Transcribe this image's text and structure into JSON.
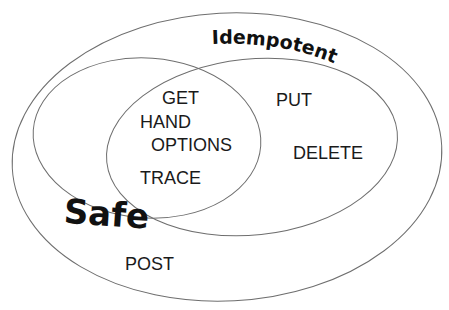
{
  "diagram": {
    "type": "venn",
    "sets": {
      "universe": {
        "label": ""
      },
      "safe": {
        "label": "Safe"
      },
      "idempotent": {
        "label": "Idempotent"
      }
    },
    "regions": {
      "safe_and_idempotent": [
        "GET",
        "HAND",
        "OPTIONS",
        "TRACE"
      ],
      "idempotent_only": [
        "PUT",
        "DELETE"
      ],
      "neither": [
        "POST"
      ]
    },
    "labels": {
      "get": "GET",
      "hand": "HAND",
      "options": "OPTIONS",
      "trace": "TRACE",
      "put": "PUT",
      "delete": "DELETE",
      "post": "POST",
      "safe_title": "Safe",
      "idempotent_title": "Idempotent"
    },
    "colors": {
      "outline": "#6e6e6e",
      "text": "#1a1a1a",
      "background": "#ffffff"
    }
  }
}
